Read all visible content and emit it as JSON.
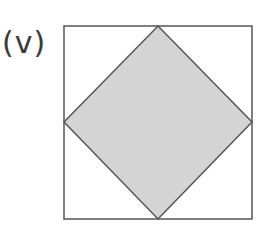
{
  "label": "(v)",
  "figure": {
    "outer_square": {
      "x": 64,
      "y": 26,
      "width": 188,
      "height": 193
    },
    "diamond_points": "158,26 252,122 158,219 64,122",
    "colors": {
      "stroke": "#555555",
      "fill": "#d4d4d4",
      "background": "#ffffff"
    }
  }
}
